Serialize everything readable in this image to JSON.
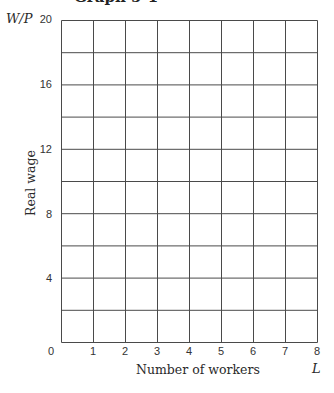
{
  "title": "Graph 5-1",
  "axes": {
    "y_var": "W/P",
    "x_var": "L",
    "y_title": "Real wage",
    "x_title": "Number of workers",
    "y_ticks": [
      "20",
      "16",
      "12",
      "8",
      "4"
    ],
    "x_ticks": [
      "0",
      "1",
      "2",
      "3",
      "4",
      "5",
      "6",
      "7",
      "8"
    ]
  },
  "chart_data": {
    "type": "line",
    "title": "Graph 5-1",
    "xlabel": "Number of workers (L)",
    "ylabel": "Real wage (W/P)",
    "xlim": [
      0,
      8
    ],
    "ylim": [
      0,
      20
    ],
    "x_ticks": [
      0,
      1,
      2,
      3,
      4,
      5,
      6,
      7,
      8
    ],
    "y_ticks": [
      4,
      8,
      12,
      16,
      20
    ],
    "grid": true,
    "grid_x_step": 1,
    "grid_y_step": 2,
    "series": [],
    "note": "Blank grid for plotting; no data plotted"
  }
}
